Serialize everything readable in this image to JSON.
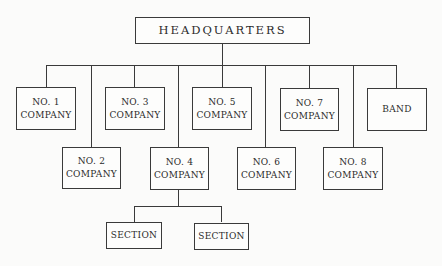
{
  "root": {
    "label": "HEADQUARTERS"
  },
  "companies": [
    {
      "line1": "NO. 1",
      "line2": "COMPANY"
    },
    {
      "line1": "NO. 2",
      "line2": "COMPANY"
    },
    {
      "line1": "NO. 3",
      "line2": "COMPANY"
    },
    {
      "line1": "NO. 4",
      "line2": "COMPANY"
    },
    {
      "line1": "NO. 5",
      "line2": "COMPANY"
    },
    {
      "line1": "NO. 6",
      "line2": "COMPANY"
    },
    {
      "line1": "NO. 7",
      "line2": "COMPANY"
    },
    {
      "line1": "NO. 8",
      "line2": "COMPANY"
    },
    {
      "line1": "BAND",
      "line2": ""
    }
  ],
  "sections": [
    {
      "label": "SECTION"
    },
    {
      "label": "SECTION"
    }
  ]
}
